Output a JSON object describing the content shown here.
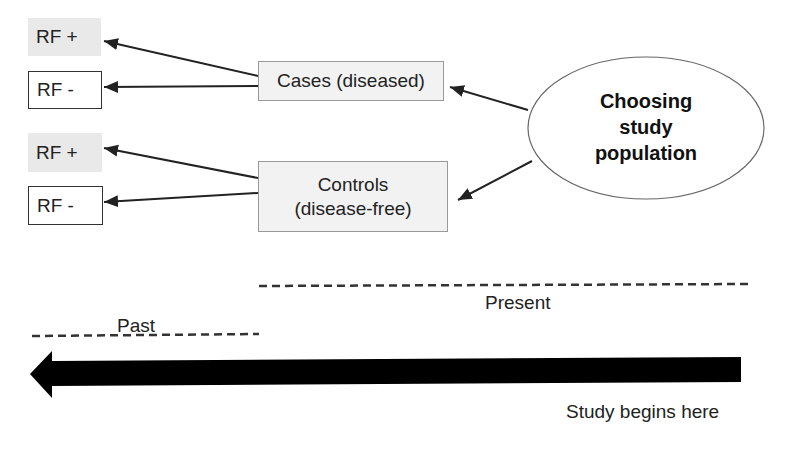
{
  "risk_factor_boxes": [
    {
      "label": "RF +",
      "type": "positive",
      "group": "cases"
    },
    {
      "label": "RF -",
      "type": "negative",
      "group": "cases"
    },
    {
      "label": "RF +",
      "type": "positive",
      "group": "controls"
    },
    {
      "label": "RF -",
      "type": "negative",
      "group": "controls"
    }
  ],
  "groups": {
    "cases": {
      "label": "Cases (diseased)"
    },
    "controls": {
      "line1": "Controls",
      "line2": "(disease-free)"
    }
  },
  "population": {
    "line1": "Choosing",
    "line2": "study",
    "line3": "population"
  },
  "timeline": {
    "present_label": "Present",
    "past_label": "Past",
    "start_label": "Study begins here",
    "direction": "right-to-left"
  },
  "colors": {
    "rf_positive_fill": "#e9e9e9",
    "group_fill": "#f2f2f2",
    "arrow": "#000000"
  }
}
